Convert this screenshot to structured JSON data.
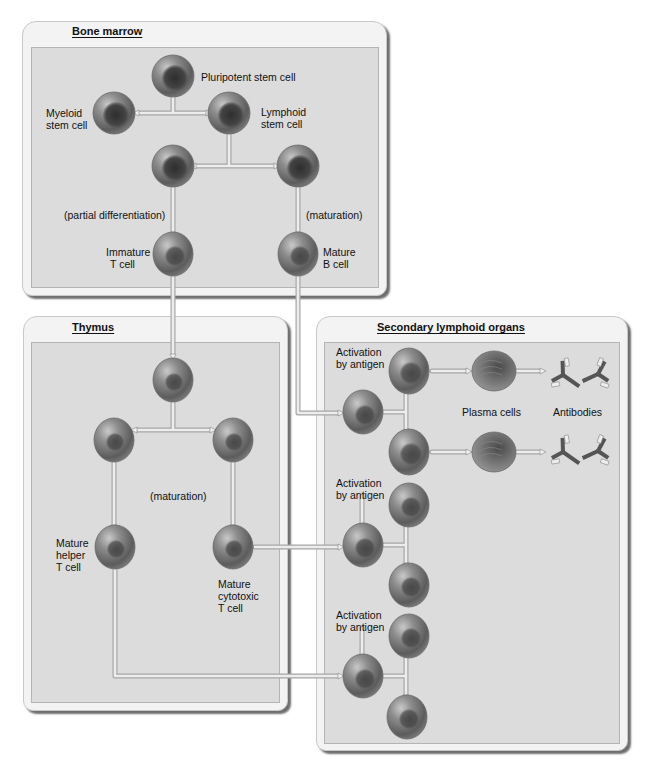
{
  "boxes": {
    "bone_marrow": {
      "title": "Bone marrow"
    },
    "thymus": {
      "title": "Thymus"
    },
    "secondary": {
      "title": "Secondary lymphoid organs"
    }
  },
  "labels": {
    "pluripotent": "Pluripotent stem cell",
    "myeloid_1": "Myeloid",
    "myeloid_2": "stem cell",
    "lymphoid_1": "Lymphoid",
    "lymphoid_2": "stem cell",
    "partial_diff": "(partial differentiation)",
    "maturation_bm": "(maturation)",
    "immature_t_1": "Immature",
    "immature_t_2": "T cell",
    "mature_b_1": "Mature",
    "mature_b_2": "B cell",
    "maturation_thymus": "(maturation)",
    "helper_1": "Mature",
    "helper_2": "helper",
    "helper_3": "T cell",
    "cytotoxic_1": "Mature",
    "cytotoxic_2": "cytotoxic",
    "cytotoxic_3": "T cell",
    "activation_1a": "Activation",
    "activation_1b": "by antigen",
    "activation_2a": "Activation",
    "activation_2b": "by antigen",
    "activation_3a": "Activation",
    "activation_3b": "by antigen",
    "plasma_cells": "Plasma cells",
    "antibodies": "Antibodies"
  },
  "colors": {
    "page_bg": "#ffffff",
    "box_bg": "#f3f3f3",
    "panel_bg": "#dcdcdc",
    "cell_outer": "#8a8a8a",
    "cell_nucleus": "#3a3a3a",
    "arrow": "#b8b8b8"
  }
}
